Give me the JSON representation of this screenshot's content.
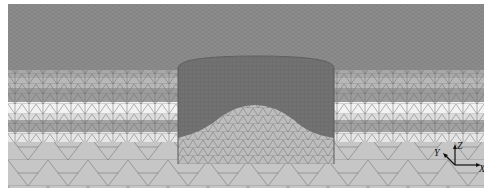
{
  "figure": {
    "colors": {
      "top_mesh": "#8c8c8c",
      "band_dark": "#9a9a9a",
      "band_mid": "#b4b4b4",
      "band_light": "#d2d2d2",
      "band_white": "#f2f2f2",
      "bottom": "#c6c6c6",
      "cylinder_wall": "#727272",
      "cylinder_floor": "#bdbdbd",
      "mesh_line": "#6a6a6a"
    }
  },
  "axes_triad": {
    "z_label": "Z",
    "y_label": "Y",
    "x_label": "X"
  }
}
